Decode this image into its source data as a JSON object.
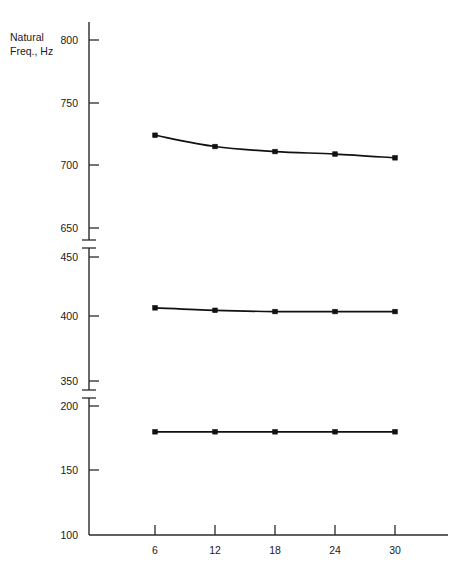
{
  "chart_data": {
    "type": "line",
    "title": "",
    "xlabel": "",
    "ylabel": "Natural Freq., Hz",
    "x": [
      6,
      12,
      18,
      24,
      30
    ],
    "xtick_labels": [
      "6",
      "12",
      "18",
      "24",
      "30"
    ],
    "series": [
      {
        "name": "upper",
        "values": [
          724,
          715,
          711,
          709,
          706
        ]
      },
      {
        "name": "middle",
        "values": [
          409,
          407,
          406,
          406,
          406
        ]
      },
      {
        "name": "lower",
        "values": [
          180,
          180,
          180,
          180,
          180
        ]
      }
    ],
    "y_axis_broken": true,
    "y_segments": [
      {
        "ticks": [
          650,
          700,
          750,
          800
        ],
        "tick_labels": [
          "650",
          "700",
          "750",
          "800"
        ],
        "range": [
          650,
          800
        ]
      },
      {
        "ticks": [
          350,
          400,
          450
        ],
        "tick_labels": [
          "350",
          "400",
          "450"
        ],
        "range": [
          350,
          450
        ]
      },
      {
        "ticks": [
          100,
          150,
          200
        ],
        "tick_labels": [
          "100",
          "150",
          "200"
        ],
        "range": [
          100,
          200
        ]
      }
    ],
    "ytick_labels_all": [
      "800",
      "750",
      "700",
      "650",
      "450",
      "400",
      "350",
      "200",
      "150",
      "100"
    ],
    "grid": false,
    "legend": "none",
    "marker_style": "filled-square",
    "line_color": "#111111",
    "axis_color": "#2a2a2a"
  },
  "axis": {
    "y_title_line1": "Natural",
    "y_title_line2": "Freq., Hz"
  }
}
